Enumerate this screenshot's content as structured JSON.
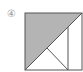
{
  "figure": {
    "label": "④",
    "colors": {
      "shade": "#b4b4b4",
      "stroke": "#555555",
      "background": "#ffffff"
    }
  }
}
